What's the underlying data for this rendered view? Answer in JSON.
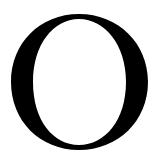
{
  "glyph": {
    "character": "O",
    "color": "#000000",
    "background": "#ffffff"
  }
}
